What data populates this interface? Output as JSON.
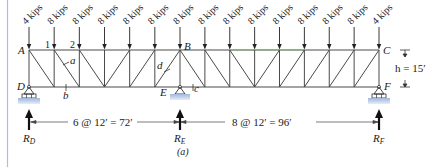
{
  "figure": {
    "caption": "(a)",
    "left_border_color": "#aebfdb",
    "chord_color": "#555555",
    "green_chord_color": "#7cb86a",
    "support_fill": "#b8cbe6"
  },
  "loads": [
    {
      "label": "4 kips",
      "node": 0
    },
    {
      "label": "8 kips",
      "node": 1
    },
    {
      "label": "8 kips",
      "node": 2
    },
    {
      "label": "8 kips",
      "node": 3
    },
    {
      "label": "8 kips",
      "node": 4
    },
    {
      "label": "8 kips",
      "node": 5
    },
    {
      "label": "8 kips",
      "node": 6
    },
    {
      "label": "8 kips",
      "node": 7
    },
    {
      "label": "8 kips",
      "node": 8
    },
    {
      "label": "8 kips",
      "node": 9
    },
    {
      "label": "8 kips",
      "node": 10
    },
    {
      "label": "8 kips",
      "node": 11
    },
    {
      "label": "8 kips",
      "node": 12
    },
    {
      "label": "8 kips",
      "node": 13
    },
    {
      "label": "4 kips",
      "node": 14
    }
  ],
  "nodes": {
    "A": "A",
    "B": "B",
    "C": "C",
    "D": "D",
    "E": "E",
    "F": "F",
    "n1": "1",
    "n2": "2"
  },
  "members": {
    "a": "a",
    "b": "b",
    "c": "c",
    "d": "d"
  },
  "dimensions": {
    "height": "h = 15′",
    "left_span": "6 @ 12′ = 72′",
    "right_span": "8 @ 12′ = 96′"
  },
  "reactions": {
    "RD": {
      "main": "R",
      "sub": "D"
    },
    "RE": {
      "main": "R",
      "sub": "E"
    },
    "RF": {
      "main": "R",
      "sub": "F"
    }
  }
}
